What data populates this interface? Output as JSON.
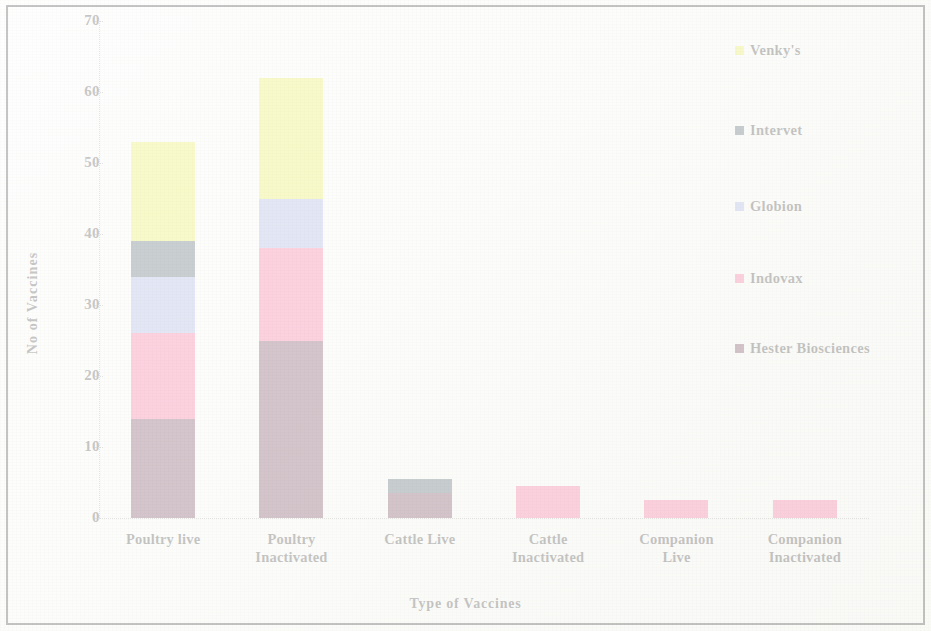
{
  "chart_data": {
    "type": "bar",
    "subtype": "stacked-vertical",
    "title": "",
    "xlabel": "Type of Vaccines",
    "ylabel": "No of Vaccines",
    "ylim": [
      0,
      70
    ],
    "y_ticks": [
      0,
      10,
      20,
      30,
      40,
      50,
      60,
      70
    ],
    "grid": false,
    "legend_position": "right",
    "categories": [
      "Poultry live",
      "Poultry Inactivated",
      "Cattle Live",
      "Cattle Inactivated",
      "Companion Live",
      "Companion Inactivated"
    ],
    "series": [
      {
        "name": "Hester Biosciences",
        "color": "#5c2040",
        "values": [
          14,
          25,
          3.5,
          0,
          0,
          0
        ]
      },
      {
        "name": "Indovax",
        "color": "#f9558c",
        "values": [
          12,
          13,
          0,
          4.5,
          2.5,
          2.5
        ]
      },
      {
        "name": "Globion",
        "color": "#98a6e2",
        "values": [
          8,
          7,
          0,
          0,
          0,
          0
        ]
      },
      {
        "name": "Intervet",
        "color": "#2e4353",
        "values": [
          5,
          0,
          2,
          0,
          0,
          0
        ]
      },
      {
        "name": "Venky's",
        "color": "#ecef38",
        "values": [
          14,
          17,
          0,
          0,
          0,
          0
        ]
      }
    ],
    "totals": [
      53,
      62,
      5.5,
      4.5,
      2.5,
      2.5
    ],
    "legend_order_top_to_bottom": [
      "Venky's",
      "Intervet",
      "Globion",
      "Indovax",
      "Hester Biosciences"
    ]
  }
}
